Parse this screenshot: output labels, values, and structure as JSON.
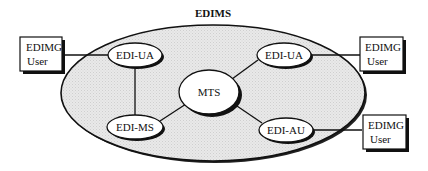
{
  "diagram": {
    "title": "EDIMS",
    "colors": {
      "system_fill": "#e6e6e6",
      "stroke": "#111111",
      "node_fill": "#ffffff",
      "background": "#ffffff"
    },
    "system_boundary": {
      "label": "EDIMS",
      "shape": "ellipse"
    },
    "nodes": [
      {
        "id": "ua_left",
        "label": "EDI-UA",
        "shape": "ellipse"
      },
      {
        "id": "ua_right",
        "label": "EDI-UA",
        "shape": "ellipse"
      },
      {
        "id": "mts",
        "label": "MTS",
        "shape": "ellipse"
      },
      {
        "id": "ms",
        "label": "EDI-MS",
        "shape": "ellipse"
      },
      {
        "id": "au",
        "label": "EDI-AU",
        "shape": "ellipse"
      }
    ],
    "users": [
      {
        "id": "user_left",
        "line1": "EDIMG",
        "line2": "User"
      },
      {
        "id": "user_right_top",
        "line1": "EDIMG",
        "line2": "User"
      },
      {
        "id": "user_right_bottom",
        "line1": "EDIMG",
        "line2": "User"
      }
    ],
    "edges": [
      {
        "from": "user_left",
        "to": "ua_left"
      },
      {
        "from": "ua_left",
        "to": "ms"
      },
      {
        "from": "ms",
        "to": "mts"
      },
      {
        "from": "mts",
        "to": "ua_right"
      },
      {
        "from": "mts",
        "to": "au"
      },
      {
        "from": "ua_right",
        "to": "user_right_top"
      },
      {
        "from": "au",
        "to": "user_right_bottom"
      }
    ]
  }
}
